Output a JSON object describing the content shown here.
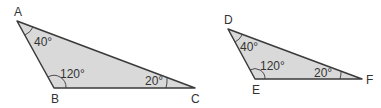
{
  "diagram": {
    "type": "similar-triangles",
    "colors": {
      "fill": "#d9d9d9",
      "stroke": "#3a3a3a",
      "text": "#333333"
    },
    "triangles": [
      {
        "name": "ABC",
        "vertices": [
          {
            "label": "A",
            "angle": "40°"
          },
          {
            "label": "B",
            "angle": "120°"
          },
          {
            "label": "C",
            "angle": "20°"
          }
        ]
      },
      {
        "name": "DEF",
        "vertices": [
          {
            "label": "D",
            "angle": "40°"
          },
          {
            "label": "E",
            "angle": "120°"
          },
          {
            "label": "F",
            "angle": "20°"
          }
        ]
      }
    ]
  }
}
